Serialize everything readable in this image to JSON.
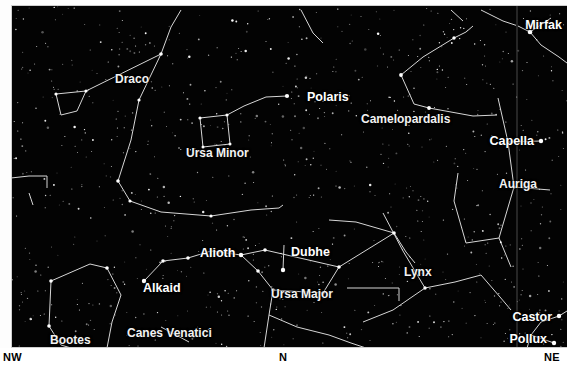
{
  "chart_data": {
    "type": "scatter",
    "xlabel": "Azimuth",
    "ylabel": "Altitude",
    "grid": false,
    "legend": "none",
    "background_color": "#030303",
    "star_color": "#ffffff",
    "line_color": "#d8d8d8",
    "label_color": "#ffffff",
    "horizon_labels": [
      "NW",
      "N",
      "NE"
    ],
    "star_labels": [
      {
        "name": "Polaris",
        "x": 290,
        "y": 92,
        "align": "left"
      },
      {
        "name": "Mirfak",
        "x": 562,
        "y": 20,
        "align": "right"
      },
      {
        "name": "Capella",
        "x": 562,
        "y": 139,
        "align": "right"
      },
      {
        "name": "Castor",
        "x": 540,
        "y": 320,
        "align": "right"
      },
      {
        "name": "Pollux",
        "x": 540,
        "y": 342,
        "align": "right"
      },
      {
        "name": "Dubhe",
        "x": 289,
        "y": 253,
        "align": "left"
      },
      {
        "name": "Alioth",
        "x": 200,
        "y": 254,
        "align": "left"
      },
      {
        "name": "Alkaid",
        "x": 146,
        "y": 290,
        "align": "left"
      }
    ],
    "constellation_labels": [
      {
        "name": "Draco",
        "x": 118,
        "y": 80
      },
      {
        "name": "Ursa Minor",
        "x": 186,
        "y": 153
      },
      {
        "name": "Camelopardalis",
        "x": 360,
        "y": 119
      },
      {
        "name": "Auriga",
        "x": 501,
        "y": 183
      },
      {
        "name": "Lynx",
        "x": 404,
        "y": 273
      },
      {
        "name": "Ursa Major",
        "x": 273,
        "y": 294
      },
      {
        "name": "Canes Venatici",
        "x": 131,
        "y": 333
      },
      {
        "name": "Bootes",
        "x": 52,
        "y": 340
      }
    ]
  },
  "labels": {
    "stars": {
      "polaris": "Polaris",
      "mirfak": "Mirfak",
      "capella": "Capella",
      "castor": "Castor",
      "pollux": "Pollux",
      "dubhe": "Dubhe",
      "alioth": "Alioth",
      "alkaid": "Alkaid"
    },
    "constellations": {
      "draco": "Draco",
      "ursa_minor": "Ursa Minor",
      "camelopardalis": "Camelopardalis",
      "auriga": "Auriga",
      "lynx": "Lynx",
      "ursa_major": "Ursa Major",
      "canes_venatici": "Canes Venatici",
      "bootes": "Bootes"
    },
    "compass": {
      "nw": "NW",
      "n": "N",
      "ne": "NE"
    }
  }
}
